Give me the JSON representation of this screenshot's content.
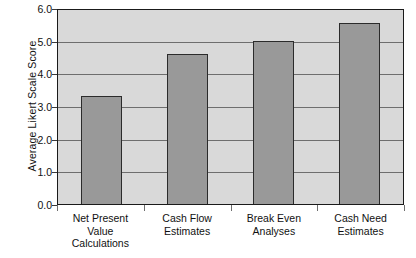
{
  "chart_data": {
    "type": "bar",
    "title": "",
    "xlabel": "",
    "ylabel": "Average Likert Scale Score",
    "ylim": [
      0.0,
      6.0
    ],
    "ytick_labels": [
      "6.0",
      "5.0",
      "4.0",
      "3.0",
      "2.0",
      "1.0",
      "0.0"
    ],
    "ytick_values": [
      6.0,
      5.0,
      4.0,
      3.0,
      2.0,
      1.0,
      0.0
    ],
    "grid": true,
    "legend": "none",
    "categories": [
      "Net Present Value Calculations",
      "Cash Flow Estimates",
      "Break Even Analyses",
      "Cash Need Estimates"
    ],
    "category_label_lines": [
      [
        "Net Present",
        "Value",
        "Calculations"
      ],
      [
        "Cash Flow",
        "Estimates"
      ],
      [
        "Break Even",
        "Analyses"
      ],
      [
        "Cash Need",
        "Estimates"
      ]
    ],
    "values": [
      3.3,
      4.6,
      5.0,
      5.55
    ],
    "colors": {
      "bar_fill": "#999999",
      "bar_border": "#2b2b2b",
      "plot_background": "#d9d9d9",
      "plot_border": "#1a1a1a",
      "gridline": "#6e6e6e",
      "text": "#111111",
      "page_background": "#ffffff"
    }
  }
}
